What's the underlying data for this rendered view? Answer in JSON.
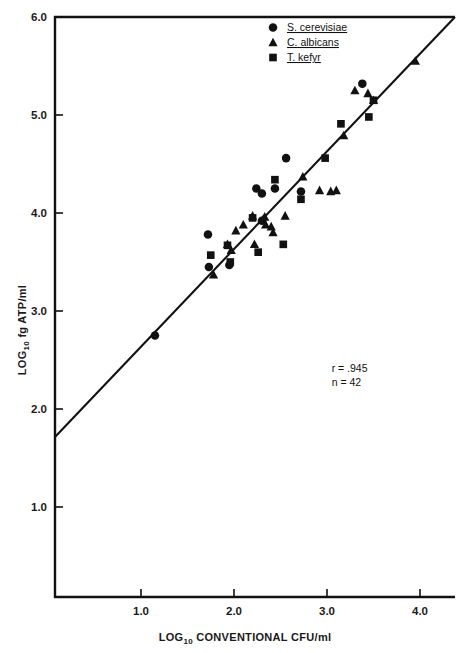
{
  "figure": {
    "background": "#ffffff",
    "ink_color": "#111111"
  },
  "chart_data": {
    "type": "scatter",
    "title": "",
    "xlabel": "LOG10 CONVENTIONAL CFU/ml",
    "xlabel_base": "LOG",
    "xlabel_sub": "10",
    "xlabel_rest": " CONVENTIONAL CFU/ml",
    "ylabel": "LOG10 fg ATP/ml",
    "ylabel_base": "LOG",
    "ylabel_sub": "10",
    "ylabel_rest": " fg ATP/ml",
    "xlim": [
      0.5,
      4.35
    ],
    "ylim": [
      0.55,
      6.0
    ],
    "xticks": [
      1.0,
      2.0,
      3.0,
      4.0
    ],
    "xticklabels": [
      "1.0",
      "2.0",
      "3.0",
      "4.0"
    ],
    "yticks": [
      1.0,
      2.0,
      3.0,
      4.0,
      5.0,
      6.0
    ],
    "yticklabels": [
      "1.0",
      "2.0",
      "3.0",
      "4.0",
      "5.0",
      "6.0"
    ],
    "grid": false,
    "legend_position": "top-right",
    "fit_line": {
      "label": "regression line",
      "x_start": 0.5,
      "y_start": 1.68,
      "x_end": 4.35,
      "y_end": 6.0
    },
    "annotations": [
      {
        "name": "correlation",
        "text": "r = .945",
        "x": 3.05,
        "y": 2.38
      },
      {
        "name": "sample-size",
        "text": "n = 42",
        "x": 3.05,
        "y": 2.23
      }
    ],
    "series": [
      {
        "name": "S. cerevisiae",
        "marker": "circle",
        "color": "#111111",
        "points": [
          [
            1.15,
            2.75
          ],
          [
            1.72,
            3.78
          ],
          [
            1.73,
            3.45
          ],
          [
            1.95,
            3.47
          ],
          [
            2.24,
            4.25
          ],
          [
            2.3,
            4.2
          ],
          [
            2.44,
            4.25
          ],
          [
            2.56,
            4.56
          ],
          [
            2.72,
            4.22
          ],
          [
            3.38,
            5.32
          ],
          [
            2.3,
            3.92
          ]
        ]
      },
      {
        "name": "C. albicans",
        "marker": "triangle",
        "color": "#111111",
        "points": [
          [
            1.78,
            3.37
          ],
          [
            1.93,
            3.68
          ],
          [
            1.97,
            3.62
          ],
          [
            2.02,
            3.82
          ],
          [
            2.1,
            3.88
          ],
          [
            2.2,
            3.97
          ],
          [
            2.22,
            3.68
          ],
          [
            2.31,
            3.93
          ],
          [
            2.34,
            3.88
          ],
          [
            2.4,
            3.86
          ],
          [
            2.42,
            3.8
          ],
          [
            2.55,
            3.97
          ],
          [
            2.74,
            4.37
          ],
          [
            2.92,
            4.23
          ],
          [
            3.04,
            4.22
          ],
          [
            3.1,
            4.23
          ],
          [
            3.18,
            4.79
          ],
          [
            3.3,
            5.25
          ],
          [
            3.44,
            5.22
          ],
          [
            3.5,
            5.15
          ],
          [
            3.95,
            5.55
          ],
          [
            2.33,
            3.96
          ]
        ]
      },
      {
        "name": "T. kefyr",
        "marker": "square",
        "color": "#111111",
        "points": [
          [
            1.75,
            3.57
          ],
          [
            1.93,
            3.67
          ],
          [
            1.96,
            3.5
          ],
          [
            2.2,
            3.95
          ],
          [
            2.26,
            3.6
          ],
          [
            2.44,
            4.34
          ],
          [
            2.53,
            3.68
          ],
          [
            2.72,
            4.14
          ],
          [
            2.98,
            4.56
          ],
          [
            3.15,
            4.91
          ],
          [
            3.5,
            5.15
          ],
          [
            3.45,
            4.98
          ]
        ]
      }
    ]
  },
  "legend": {
    "items": [
      {
        "marker": "circle",
        "label": "S. cerevisiae"
      },
      {
        "marker": "triangle",
        "label": "C. albicans"
      },
      {
        "marker": "square",
        "label": "T. kefyr"
      }
    ]
  }
}
